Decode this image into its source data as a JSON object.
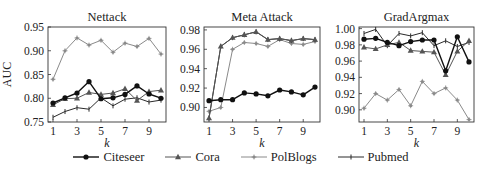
{
  "chart_data": [
    {
      "type": "line",
      "title": "Nettack",
      "xlabel": "k",
      "ylabel": "AUC",
      "x": [
        1,
        2,
        3,
        4,
        5,
        6,
        7,
        8,
        9,
        10
      ],
      "xticks": [
        1,
        3,
        5,
        7,
        9
      ],
      "ylim": [
        0.75,
        0.95
      ],
      "yticks": [
        0.75,
        0.8,
        0.85,
        0.9,
        0.95
      ],
      "ytick_labels": [
        "0.75",
        "0.80",
        "0.85",
        "0.90",
        "0.95"
      ],
      "grid": false,
      "series": [
        {
          "name": "Citeseer",
          "values": [
            0.79,
            0.801,
            0.811,
            0.835,
            0.799,
            0.801,
            0.808,
            0.826,
            0.809,
            0.8
          ]
        },
        {
          "name": "Cora",
          "values": [
            0.786,
            0.799,
            0.8,
            0.812,
            0.808,
            0.811,
            0.82,
            0.795,
            0.814,
            0.817
          ]
        },
        {
          "name": "PolBlogs",
          "values": [
            0.84,
            0.9,
            0.927,
            0.912,
            0.922,
            0.897,
            0.916,
            0.909,
            0.926,
            0.893
          ]
        },
        {
          "name": "Pubmed",
          "values": [
            0.76,
            0.772,
            0.78,
            0.777,
            0.801,
            0.784,
            0.798,
            0.801,
            0.792,
            0.796
          ]
        }
      ]
    },
    {
      "type": "line",
      "title": "Meta Attack",
      "xlabel": "k",
      "ylabel": "",
      "x": [
        1,
        2,
        3,
        4,
        5,
        6,
        7,
        8,
        9,
        10
      ],
      "xticks": [
        1,
        3,
        5,
        7,
        9
      ],
      "ylim": [
        0.885,
        0.983
      ],
      "yticks": [
        0.9,
        0.92,
        0.94,
        0.96,
        0.98
      ],
      "ytick_labels": [
        "0.90",
        "0.92",
        "0.94",
        "0.96",
        "0.98"
      ],
      "grid": false,
      "series": [
        {
          "name": "Citeseer",
          "values": [
            0.907,
            0.908,
            0.908,
            0.915,
            0.914,
            0.912,
            0.918,
            0.916,
            0.913,
            0.921
          ]
        },
        {
          "name": "Cora",
          "values": [
            0.889,
            0.963,
            0.972,
            0.975,
            0.978,
            0.97,
            0.971,
            0.969,
            0.971,
            0.97
          ]
        },
        {
          "name": "PolBlogs",
          "values": [
            0.896,
            0.9,
            0.96,
            0.967,
            0.966,
            0.963,
            0.97,
            0.966,
            0.965,
            0.968
          ]
        },
        {
          "name": "Pubmed",
          "values": [
            0.889,
            0.963,
            0.972,
            0.975,
            0.978,
            0.97,
            0.971,
            0.969,
            0.971,
            0.97
          ]
        }
      ]
    },
    {
      "type": "line",
      "title": "GradArgmax",
      "xlabel": "k",
      "ylabel": "",
      "x": [
        1,
        2,
        3,
        4,
        5,
        6,
        7,
        8,
        9,
        10
      ],
      "xticks": [
        1,
        3,
        5,
        7,
        9
      ],
      "ylim": [
        0.885,
        1.002
      ],
      "yticks": [
        0.9,
        0.92,
        0.94,
        0.96,
        0.98,
        1.0
      ],
      "ytick_labels": [
        "0.90",
        "0.92",
        "0.94",
        "0.96",
        "0.98",
        "1.00"
      ],
      "grid": false,
      "series": [
        {
          "name": "Citeseer",
          "values": [
            0.987,
            0.988,
            0.983,
            0.979,
            0.984,
            0.986,
            0.986,
            0.948,
            0.99,
            0.959
          ]
        },
        {
          "name": "Cora",
          "values": [
            0.977,
            0.975,
            0.98,
            0.983,
            0.973,
            0.972,
            0.971,
            0.943,
            0.972,
            0.985
          ]
        },
        {
          "name": "PolBlogs",
          "values": [
            0.902,
            0.92,
            0.912,
            0.925,
            0.905,
            0.935,
            0.92,
            0.927,
            0.912,
            0.888
          ]
        },
        {
          "name": "Pubmed",
          "values": [
            0.994,
            0.999,
            0.979,
            0.994,
            0.991,
            0.995,
            0.979,
            0.985,
            0.978,
            0.983
          ]
        }
      ]
    }
  ],
  "series_styles": {
    "Citeseer": {
      "color": "#111111",
      "marker": "circle",
      "width": 1.4
    },
    "Cora": {
      "color": "#555555",
      "marker": "triangle",
      "width": 1.0
    },
    "PolBlogs": {
      "color": "#8a8a8a",
      "marker": "star",
      "width": 1.0
    },
    "Pubmed": {
      "color": "#2a2a2a",
      "marker": "plus",
      "width": 1.0
    }
  },
  "legend": {
    "position": "bottom",
    "items": [
      "Citeseer",
      "Cora",
      "PolBlogs",
      "Pubmed"
    ]
  }
}
